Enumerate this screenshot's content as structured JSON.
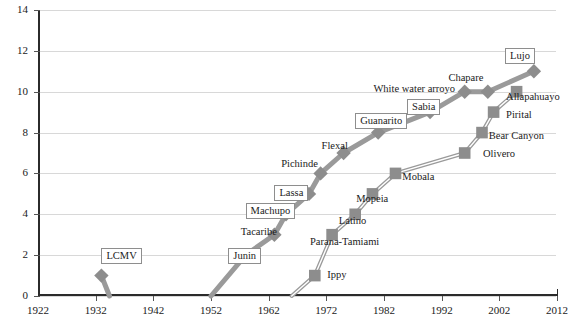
{
  "chart_data": {
    "type": "scatter",
    "title": "",
    "xlabel": "",
    "ylabel": "",
    "xlim": [
      1922,
      2012
    ],
    "ylim": [
      0,
      14
    ],
    "xticks": [
      1922,
      1932,
      1942,
      1952,
      1962,
      1972,
      1982,
      1992,
      2002,
      2012
    ],
    "yticks": [
      0,
      2,
      4,
      6,
      8,
      10,
      12,
      14
    ],
    "grid": true,
    "legend": "none",
    "series": [
      {
        "name": "New World arenaviruses",
        "marker": "diamond",
        "color": "#8d8d8d",
        "points": [
          {
            "label": "LCMV",
            "x": 1933,
            "y": 1,
            "boxed": true
          },
          {
            "label": "Junin",
            "x": 1958,
            "y": 2,
            "boxed": true
          },
          {
            "label": "Tacaribe",
            "x": 1963,
            "y": 3,
            "boxed": false
          },
          {
            "label": "Machupo",
            "x": 1965,
            "y": 4,
            "boxed": true
          },
          {
            "label": "Lassa",
            "x": 1969,
            "y": 5,
            "boxed": true
          },
          {
            "label": "Pichinde",
            "x": 1971,
            "y": 6,
            "boxed": false
          },
          {
            "label": "Flexal",
            "x": 1975,
            "y": 7,
            "boxed": false
          },
          {
            "label": "Guanarito",
            "x": 1981,
            "y": 8,
            "boxed": true
          },
          {
            "label": "Sabia",
            "x": 1990,
            "y": 9,
            "boxed": true
          },
          {
            "label": "White water arroyo",
            "x": 1996,
            "y": 10,
            "boxed": false
          },
          {
            "label": "Chapare",
            "x": 2000,
            "y": 10,
            "boxed": false
          },
          {
            "label": "Lujo",
            "x": 2008,
            "y": 11,
            "boxed": true
          }
        ]
      },
      {
        "name": "Old World arenaviruses",
        "marker": "square",
        "color": "#8d8d8d",
        "points": [
          {
            "label": "Ippy",
            "x": 1970,
            "y": 1,
            "boxed": false
          },
          {
            "label": "Parana-Tamiami",
            "x": 1973,
            "y": 3,
            "boxed": false
          },
          {
            "label": "Latino",
            "x": 1977,
            "y": 4,
            "boxed": false
          },
          {
            "label": "Mopeia",
            "x": 1980,
            "y": 5,
            "boxed": false
          },
          {
            "label": "Mobala",
            "x": 1984,
            "y": 6,
            "boxed": false
          },
          {
            "label": "Olivero",
            "x": 1996,
            "y": 7,
            "boxed": false
          },
          {
            "label": "Bear Canyon",
            "x": 1999,
            "y": 8,
            "boxed": false
          },
          {
            "label": "Pirital",
            "x": 2001,
            "y": 9,
            "boxed": false
          },
          {
            "label": "Allapahuayo",
            "x": 2005,
            "y": 10,
            "boxed": false
          }
        ]
      }
    ],
    "annotations": [
      {
        "text": "LCMV",
        "x": 1933,
        "y": 2,
        "boxed": true
      },
      {
        "text": "Junin",
        "x": 1955,
        "y": 2,
        "boxed": true
      },
      {
        "text": "Tacaribe",
        "x": 1957,
        "y": 3.1,
        "boxed": false
      },
      {
        "text": "Machupo",
        "x": 1958,
        "y": 4.2,
        "boxed": true
      },
      {
        "text": "Lassa",
        "x": 1963,
        "y": 5.1,
        "boxed": true
      },
      {
        "text": "Pichinde",
        "x": 1964,
        "y": 6.4,
        "boxed": false
      },
      {
        "text": "Flexal",
        "x": 1971,
        "y": 7.3,
        "boxed": false
      },
      {
        "text": "Guanarito",
        "x": 1977,
        "y": 8.6,
        "boxed": true
      },
      {
        "text": "Sabia",
        "x": 1986,
        "y": 9.3,
        "boxed": true
      },
      {
        "text": "White water arroyo",
        "x": 1980,
        "y": 10.1,
        "boxed": false
      },
      {
        "text": "Chapare",
        "x": 1993,
        "y": 10.6,
        "boxed": false
      },
      {
        "text": "Lujo",
        "x": 2003,
        "y": 11.8,
        "boxed": true
      },
      {
        "text": "Allapahuayo",
        "x": 2003,
        "y": 9.7,
        "boxed": false
      },
      {
        "text": "Pirital",
        "x": 2003,
        "y": 8.8,
        "boxed": false
      },
      {
        "text": "Bear Canyon",
        "x": 2000,
        "y": 7.8,
        "boxed": false
      },
      {
        "text": "Olivero",
        "x": 1999,
        "y": 6.9,
        "boxed": false
      },
      {
        "text": "Mobala",
        "x": 1985,
        "y": 5.8,
        "boxed": false
      },
      {
        "text": "Mopeia",
        "x": 1977,
        "y": 4.7,
        "boxed": false
      },
      {
        "text": "Latino",
        "x": 1974,
        "y": 3.6,
        "boxed": false
      },
      {
        "text": "Parana-Tamiami",
        "x": 1969,
        "y": 2.6,
        "boxed": false
      },
      {
        "text": "Ippy",
        "x": 1972,
        "y": 1,
        "boxed": false
      }
    ]
  },
  "axes": {
    "y_tick_labels": [
      "0",
      "2",
      "4",
      "6",
      "8",
      "10",
      "12",
      "14"
    ],
    "x_tick_labels": [
      "1922",
      "1932",
      "1942",
      "1952",
      "1962",
      "1972",
      "1982",
      "1992",
      "2002",
      "2012"
    ]
  },
  "colors": {
    "marker_gray": "#8d8d8d",
    "line_gray": "#9a9a9a",
    "grid": "#d8d8d8",
    "axis": "#2b2b2b",
    "text": "#1a1a1a"
  }
}
